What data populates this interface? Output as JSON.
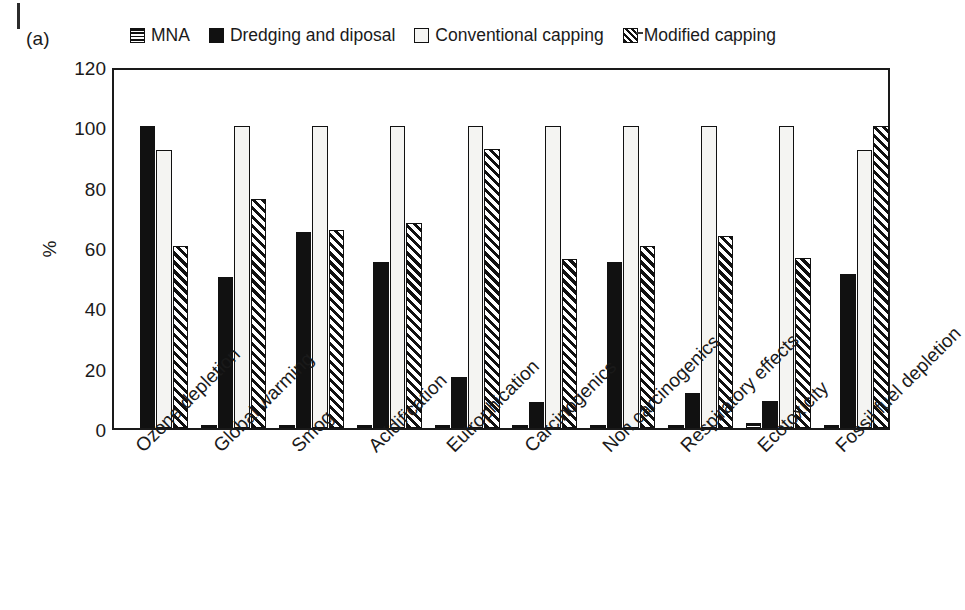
{
  "figure": {
    "panel_label": "(a)",
    "y_axis_title": "%"
  },
  "legend": {
    "items": [
      {
        "label": "MNA",
        "swatch": "horizontal-stripe-swatch"
      },
      {
        "label": "Dredging and diposal",
        "swatch": "solid-black-swatch"
      },
      {
        "label": "Conventional capping",
        "swatch": "white-swatch"
      },
      {
        "label": "Modified capping",
        "swatch": "diagonal-hatch-swatch"
      }
    ]
  },
  "chart_data": {
    "type": "bar",
    "title": "",
    "xlabel": "",
    "ylabel": "%",
    "ylim": [
      0,
      120
    ],
    "yticks": [
      0,
      20,
      40,
      60,
      80,
      100,
      120
    ],
    "grid": false,
    "legend_position": "top",
    "categories": [
      "Ozone depletion",
      "Global warming",
      "Smog",
      "Acidification",
      "Eutrophication",
      "Carcinogenics",
      "Non carcinogenics",
      "Respiratory effects",
      "Ecotoxicity",
      "Fossil fuel depletion"
    ],
    "series": [
      {
        "name": "MNA",
        "values": [
          0,
          0.6,
          0.4,
          0.4,
          0.4,
          0.5,
          0.5,
          0.4,
          1.5,
          0.5
        ]
      },
      {
        "name": "Dredging and diposal",
        "values": [
          100,
          50,
          65,
          55,
          17,
          8.5,
          55,
          11.5,
          9,
          51
        ]
      },
      {
        "name": "Conventional capping",
        "values": [
          92,
          100,
          100,
          100,
          100,
          100,
          100,
          100,
          100,
          92
        ]
      },
      {
        "name": "Modified capping",
        "values": [
          60.5,
          76,
          65.5,
          68,
          92.5,
          56,
          60.5,
          63.5,
          56.5,
          100
        ]
      }
    ]
  },
  "colors": {
    "axis": "#1a1a1a",
    "solid_series": "#111111",
    "open_series": "#f4f4f2",
    "background": "#ffffff"
  }
}
